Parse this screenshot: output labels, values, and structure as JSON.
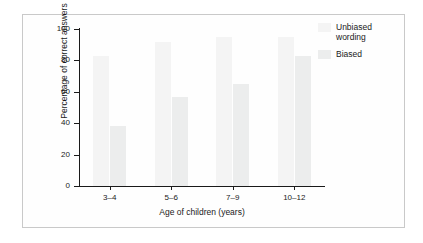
{
  "chart_data": {
    "type": "bar",
    "title": "",
    "xlabel": "Age of children (years)",
    "ylabel": "Percentage of correct answers",
    "categories": [
      "3–4",
      "5–6",
      "7–9",
      "10–12"
    ],
    "series": [
      {
        "name": "Unbiased wording",
        "values": [
          83,
          92,
          95,
          95
        ],
        "color": "#f4f4f4"
      },
      {
        "name": "Biased",
        "values": [
          38,
          57,
          65,
          83
        ],
        "color": "#eceded"
      }
    ],
    "ylim": [
      0,
      100
    ],
    "yticks": [
      0,
      20,
      40,
      60,
      80,
      100
    ],
    "ytick_labels": [
      "0",
      "20",
      "40",
      "60",
      "80",
      "100"
    ],
    "grid": false,
    "legend_position": "top-right"
  },
  "legend": {
    "entries": [
      {
        "label_line1": "Unbiased",
        "label_line2": "wording"
      },
      {
        "label_line1": "Biased",
        "label_line2": ""
      }
    ]
  },
  "axes": {
    "y_title": "Percentage of correct answers",
    "x_title": "Age of children (years)"
  }
}
